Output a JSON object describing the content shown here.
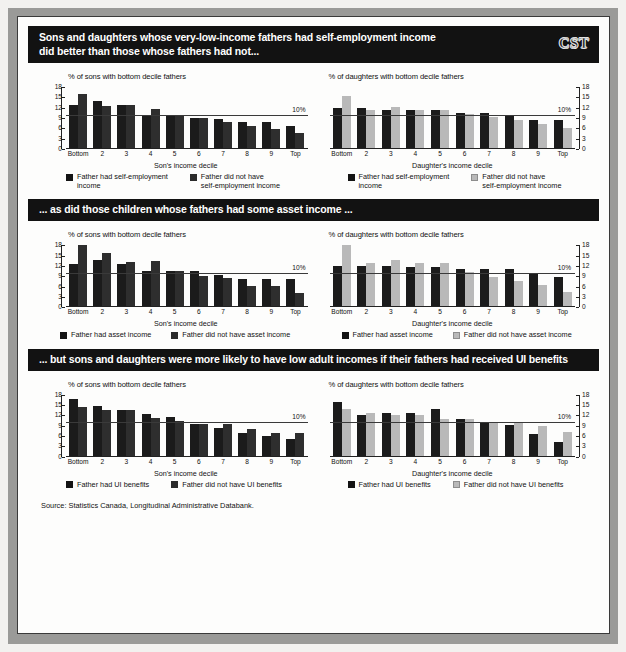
{
  "logo": "CST",
  "source": "Source: Statistics Canada, Longitudinal Administrative Databank.",
  "sections": [
    {
      "id": "self-employment",
      "banner": "Sons and daughters whose very-low-income fathers had self-employment income\ndid better than those whose fathers had not...",
      "sons": {
        "title": "% of sons with bottom decile fathers",
        "xlabel": "Son's  income decile",
        "legend": [
          {
            "label": "Father had self-employment\nincome",
            "swatch": "dark"
          },
          {
            "label": "Father did not have\nself-employment income",
            "swatch": "dark2"
          }
        ]
      },
      "daughters": {
        "title": "% of daughters with bottom decile fathers",
        "xlabel": "Daughter's  income decile",
        "legend": [
          {
            "label": "Father had self-employment\nincome",
            "swatch": "dark"
          },
          {
            "label": "Father did not have\nself-employment income",
            "swatch": "light"
          }
        ]
      }
    },
    {
      "id": "asset-income",
      "banner": "... as did those children whose fathers had some asset income ...",
      "sons": {
        "title": "% of sons with bottom decile fathers",
        "xlabel": "Son's  income decile",
        "legend": [
          {
            "label": "Father had asset income",
            "swatch": "dark"
          },
          {
            "label": "Father did not have asset income",
            "swatch": "dark2"
          }
        ]
      },
      "daughters": {
        "title": "% of daughters with bottom decile fathers",
        "xlabel": "Daughter's  income decile",
        "legend": [
          {
            "label": "Father had asset income",
            "swatch": "dark"
          },
          {
            "label": "Father did not have asset income",
            "swatch": "light"
          }
        ]
      }
    },
    {
      "id": "ui-benefits",
      "banner": "... but sons and daughters were more likely to have low adult incomes if their fathers had received UI benefits",
      "sons": {
        "title": "% of sons with bottom decile fathers",
        "xlabel": "Son's  income decile",
        "legend": [
          {
            "label": "Father had UI benefits",
            "swatch": "dark"
          },
          {
            "label": "Father did not have UI benefits",
            "swatch": "dark2"
          }
        ]
      },
      "daughters": {
        "title": "% of daughters with bottom decile fathers",
        "xlabel": "Daughter's  income decile",
        "legend": [
          {
            "label": "Father had UI benefits",
            "swatch": "dark"
          },
          {
            "label": "Father did not have UI benefits",
            "swatch": "light"
          }
        ]
      }
    }
  ],
  "chart_data": [
    {
      "id": "sons-self-employment",
      "type": "bar",
      "title": "% of sons with bottom decile fathers",
      "xlabel": "Son's  income decile",
      "ylabel": "",
      "ylim": [
        0,
        18
      ],
      "yticks": [
        0,
        3,
        6,
        9,
        12,
        15,
        18
      ],
      "axis_side": "left",
      "grid": false,
      "annotation": {
        "label": "10%",
        "value": 10
      },
      "categories": [
        "Bottom",
        "2",
        "3",
        "4",
        "5",
        "6",
        "7",
        "8",
        "9",
        "Top"
      ],
      "series": [
        {
          "name": "Father had self-employment income",
          "color": "#1b1b1b",
          "values": [
            12.8,
            14.0,
            12.8,
            10.0,
            10.0,
            8.9,
            8.8,
            7.7,
            7.7,
            6.6
          ]
        },
        {
          "name": "Father did not have self-employment income",
          "color": "#2e2e2e",
          "values": [
            16.0,
            12.4,
            12.8,
            11.7,
            10.0,
            8.9,
            7.8,
            6.8,
            5.7,
            4.7
          ]
        }
      ]
    },
    {
      "id": "daughters-self-employment",
      "type": "bar",
      "title": "% of daughters with bottom decile fathers",
      "xlabel": "Daughter's  income decile",
      "ylabel": "",
      "ylim": [
        0,
        18
      ],
      "yticks": [
        0,
        3,
        6,
        9,
        12,
        15,
        18
      ],
      "axis_side": "right",
      "grid": false,
      "annotation": {
        "label": "10%",
        "value": 10
      },
      "categories": [
        "Bottom",
        "2",
        "3",
        "4",
        "5",
        "6",
        "7",
        "8",
        "9",
        "Top"
      ],
      "series": [
        {
          "name": "Father had self-employment income",
          "color": "#1b1b1b",
          "values": [
            12.0,
            12.0,
            11.4,
            11.3,
            11.3,
            10.4,
            10.6,
            9.5,
            8.4,
            8.3
          ]
        },
        {
          "name": "Father did not have self-employment income",
          "color": "#b9b9b9",
          "values": [
            15.4,
            11.3,
            12.3,
            11.3,
            11.3,
            10.3,
            9.3,
            8.3,
            7.3,
            6.0
          ]
        }
      ]
    },
    {
      "id": "sons-asset-income",
      "type": "bar",
      "title": "% of sons with bottom decile fathers",
      "xlabel": "Son's  income decile",
      "ylabel": "",
      "ylim": [
        0,
        18
      ],
      "yticks": [
        0,
        3,
        6,
        9,
        12,
        15,
        18
      ],
      "axis_side": "left",
      "grid": false,
      "annotation": {
        "label": "10%",
        "value": 10
      },
      "categories": [
        "Bottom",
        "2",
        "3",
        "4",
        "5",
        "6",
        "7",
        "8",
        "9",
        "Top"
      ],
      "series": [
        {
          "name": "Father had asset income",
          "color": "#1b1b1b",
          "values": [
            12.5,
            13.8,
            12.4,
            10.4,
            10.4,
            10.4,
            9.4,
            8.3,
            8.3,
            8.3
          ]
        },
        {
          "name": "Father did not have asset income",
          "color": "#2e2e2e",
          "values": [
            18.0,
            15.8,
            13.0,
            13.3,
            10.4,
            9.2,
            8.4,
            6.2,
            6.2,
            4.0
          ]
        }
      ]
    },
    {
      "id": "daughters-asset-income",
      "type": "bar",
      "title": "% of daughters with bottom decile fathers",
      "xlabel": "Daughter's  income decile",
      "ylabel": "",
      "ylim": [
        0,
        18
      ],
      "yticks": [
        0,
        3,
        6,
        9,
        12,
        15,
        18
      ],
      "axis_side": "right",
      "grid": false,
      "annotation": {
        "label": "10%",
        "value": 10
      },
      "categories": [
        "Bottom",
        "2",
        "3",
        "4",
        "5",
        "6",
        "7",
        "8",
        "9",
        "Top"
      ],
      "series": [
        {
          "name": "Father had asset income",
          "color": "#1b1b1b",
          "values": [
            12.0,
            12.0,
            12.0,
            11.8,
            11.7,
            11.0,
            11.0,
            11.0,
            10.0,
            8.7
          ]
        },
        {
          "name": "Father did not have asset income",
          "color": "#b9b9b9",
          "values": [
            18.0,
            12.8,
            13.8,
            12.7,
            12.7,
            10.2,
            8.7,
            7.6,
            6.5,
            4.3
          ]
        }
      ]
    },
    {
      "id": "sons-ui-benefits",
      "type": "bar",
      "title": "% of sons with bottom decile fathers",
      "xlabel": "Son's  income decile",
      "ylabel": "",
      "ylim": [
        0,
        18
      ],
      "yticks": [
        0,
        3,
        6,
        9,
        12,
        15,
        18
      ],
      "axis_side": "left",
      "grid": false,
      "annotation": {
        "label": "10%",
        "value": 10
      },
      "categories": [
        "Bottom",
        "2",
        "3",
        "4",
        "5",
        "6",
        "7",
        "8",
        "9",
        "Top"
      ],
      "series": [
        {
          "name": "Father had UI benefits",
          "color": "#1b1b1b",
          "values": [
            16.8,
            14.7,
            13.5,
            12.5,
            11.5,
            9.4,
            8.3,
            6.9,
            6.1,
            5.1
          ]
        },
        {
          "name": "Father did not have UI benefits",
          "color": "#2e2e2e",
          "values": [
            14.6,
            13.5,
            13.5,
            11.4,
            10.3,
            9.4,
            9.4,
            8.2,
            6.8,
            7.0
          ]
        }
      ]
    },
    {
      "id": "daughters-ui-benefits",
      "type": "bar",
      "title": "% of daughters with bottom decile fathers",
      "xlabel": "Daughter's  income decile",
      "ylabel": "",
      "ylim": [
        0,
        18
      ],
      "yticks": [
        0,
        3,
        6,
        9,
        12,
        15,
        18
      ],
      "axis_side": "right",
      "grid": false,
      "annotation": {
        "label": "10%",
        "value": 10
      },
      "categories": [
        "Bottom",
        "2",
        "3",
        "4",
        "5",
        "6",
        "7",
        "8",
        "9",
        "Top"
      ],
      "series": [
        {
          "name": "Father had UI benefits",
          "color": "#1b1b1b",
          "values": [
            16.0,
            12.0,
            12.8,
            12.8,
            14.0,
            11.0,
            10.0,
            9.3,
            6.5,
            4.4
          ]
        },
        {
          "name": "Father did not have UI benefits",
          "color": "#b9b9b9",
          "values": [
            13.9,
            12.8,
            12.0,
            12.0,
            11.0,
            11.0,
            10.0,
            10.1,
            8.8,
            7.3
          ]
        }
      ]
    }
  ]
}
